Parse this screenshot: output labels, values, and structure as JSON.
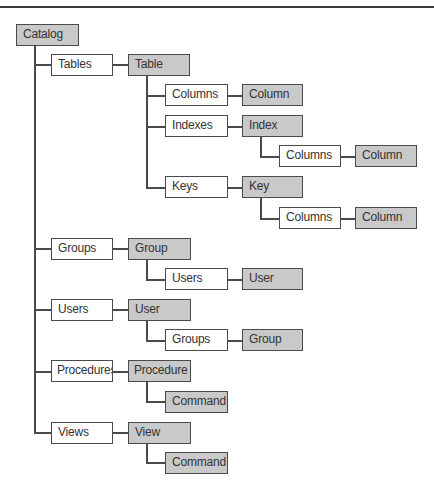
{
  "diagram": {
    "colors": {
      "object_fill": "#c9c9c9",
      "collection_fill": "#ffffff",
      "line": "#4a4a4a"
    },
    "nodes": {
      "catalog": "Catalog",
      "tables": "Tables",
      "table": "Table",
      "table_columns": "Columns",
      "table_column": "Column",
      "indexes": "Indexes",
      "index": "Index",
      "index_columns": "Columns",
      "index_column": "Column",
      "keys": "Keys",
      "key": "Key",
      "key_columns": "Columns",
      "key_column": "Column",
      "groups": "Groups",
      "group": "Group",
      "group_users": "Users",
      "group_user": "User",
      "users": "Users",
      "user": "User",
      "user_groups": "Groups",
      "user_group": "Group",
      "procedures": "Procedures",
      "procedure": "Procedure",
      "procedure_command": "Command",
      "views": "Views",
      "view": "View",
      "view_command": "Command"
    },
    "legend": {
      "gray_boxes": "objects",
      "white_boxes": "collections"
    }
  }
}
